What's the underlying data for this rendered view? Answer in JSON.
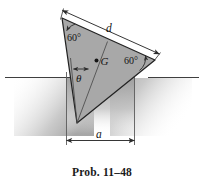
{
  "figure": {
    "caption": "Prob. 11–48",
    "labels": {
      "d": "d",
      "a": "a",
      "theta": "θ",
      "g": "G",
      "angle_top_left": "60°",
      "angle_right": "60°"
    },
    "colors": {
      "body_fill": "#a8a8a8",
      "body_stroke": "#2b2b2b",
      "ground_line": "#4a4a4a",
      "shadow": "#b5b5b5",
      "text": "#151515"
    },
    "icon_names": {
      "ground_line": "ground-line-icon",
      "center_of_gravity": "center-of-gravity-dot-icon",
      "dimension_arrow": "dimension-arrow-icon"
    }
  }
}
